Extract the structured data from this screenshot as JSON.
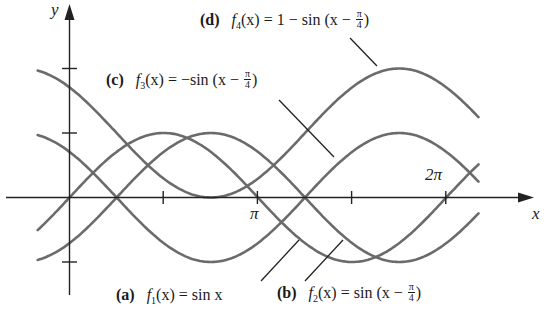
{
  "figure": {
    "axes": {
      "x_label": "x",
      "y_label": "y",
      "x_tick_labels": [
        {
          "value": "pi",
          "label": "π"
        },
        {
          "value": "2pi",
          "label": "2π"
        }
      ],
      "x_ticks": [
        "π/2",
        "π",
        "3π/2",
        "2π"
      ],
      "y_ticks": [
        -1,
        1,
        2
      ]
    },
    "labels": {
      "a": {
        "tag": "(a)",
        "func": "f",
        "sub": "1",
        "lhs_arg": "(x)",
        "eq": "=",
        "rhs": "sin x"
      },
      "b": {
        "tag": "(b)",
        "func": "f",
        "sub": "2",
        "lhs_arg": "(x)",
        "eq": "=",
        "rhs": "sin (x −",
        "num": "π",
        "den": "4",
        "close": ")"
      },
      "c": {
        "tag": "(c)",
        "func": "f",
        "sub": "3",
        "lhs_arg": "(x)",
        "eq": "=",
        "rhs": "−sin (x −",
        "num": "π",
        "den": "4",
        "close": ")"
      },
      "d": {
        "tag": "(d)",
        "func": "f",
        "sub": "4",
        "lhs_arg": "(x)",
        "eq": "=",
        "rhs": "1 − sin (x −",
        "num": "π",
        "den": "4",
        "close": ")"
      }
    },
    "colors": {
      "curve": "#6b6b6b",
      "axis": "#222222",
      "leader": "#222222"
    }
  },
  "chart_data": {
    "type": "line",
    "title": "",
    "xlabel": "x",
    "ylabel": "y",
    "xlim": [
      -0.53,
      6.82
    ],
    "ylim": [
      -1.5,
      2.8
    ],
    "grid": false,
    "x_ticks": [
      1.5708,
      3.1416,
      4.7124,
      6.2832
    ],
    "x_tick_labels": [
      "",
      "π",
      "",
      "2π"
    ],
    "y_ticks": [
      -1,
      1,
      2
    ],
    "series": [
      {
        "name": "(a) f1(x) = sin x",
        "expr": "sin(x)"
      },
      {
        "name": "(b) f2(x) = sin(x − π/4)",
        "expr": "sin(x - pi/4)"
      },
      {
        "name": "(c) f3(x) = −sin(x − π/4)",
        "expr": "-sin(x - pi/4)"
      },
      {
        "name": "(d) f4(x) = 1 − sin(x − π/4)",
        "expr": "1 - sin(x - pi/4)"
      }
    ],
    "legend_position": "inline annotations with leader lines"
  }
}
